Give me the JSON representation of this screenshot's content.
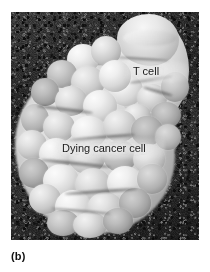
{
  "figure": {
    "caption": "(b)",
    "alt_description": "Scanning electron micrograph of a T cell attached to a dying cancer cell",
    "panel_letter": "b"
  },
  "micrograph": {
    "type": "scanning-electron-micrograph",
    "background_color": "#3a3a3a",
    "cell_color_light": "#efefef",
    "cell_color_mid": "#c4c4c4",
    "cell_color_dark": "#7a7a7a",
    "labels": [
      {
        "id": "t-cell",
        "text": "T cell",
        "color": "#1a1a1a"
      },
      {
        "id": "dying-cancer-cell",
        "text": "Dying cancer cell",
        "color": "#1a1a1a"
      }
    ]
  }
}
